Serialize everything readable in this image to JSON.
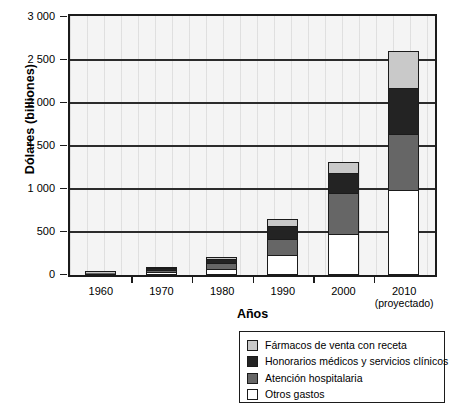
{
  "chart_data": {
    "type": "bar",
    "subtype": "stacked-bar",
    "title": "",
    "xlabel": "Años",
    "ylabel": "Dólares (billiones)",
    "ylim": [
      0,
      3000
    ],
    "ytick_labels": [
      "3 000",
      "2 500",
      "2 000",
      "1 500",
      "1 000",
      "500",
      "0"
    ],
    "ytick_values": [
      3000,
      2500,
      2000,
      1500,
      1000,
      500,
      0
    ],
    "grid": "horizontal",
    "legend_position": "bottom-right",
    "categories": [
      "1960",
      "1970",
      "1980",
      "1990",
      "2000",
      "2010"
    ],
    "category_sublabels": [
      "",
      "",
      "",
      "",
      "",
      "(proyectado)"
    ],
    "series": [
      {
        "name": "Otros gastos",
        "color": "#ffffff",
        "values": [
          10,
          30,
          70,
          230,
          480,
          990
        ]
      },
      {
        "name": "Atención hospitalaria",
        "color": "#666666",
        "values": [
          9,
          28,
          65,
          185,
          470,
          650
        ]
      },
      {
        "name": "Honorarios médicos y servicios clínicos",
        "color": "#232323",
        "values": [
          5,
          18,
          50,
          160,
          240,
          540
        ]
      },
      {
        "name": "Fármacos de venta con receta",
        "color": "#c9c9c9",
        "values": [
          3,
          9,
          20,
          75,
          120,
          430
        ]
      }
    ],
    "totals": [
      27,
      85,
      205,
      650,
      1310,
      2610
    ]
  },
  "legend": {
    "items": [
      {
        "label": "Fármacos de venta con receta",
        "color": "#c9c9c9"
      },
      {
        "label": "Honorarios médicos y servicios clínicos",
        "color": "#232323"
      },
      {
        "label": "Atención hospitalaria",
        "color": "#666666"
      },
      {
        "label": "Otros gastos",
        "color": "#ffffff"
      }
    ]
  },
  "axes": {
    "y_title": "Dólares (billiones)",
    "x_title": "Años"
  }
}
